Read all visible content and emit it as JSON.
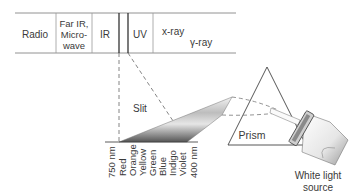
{
  "spectrum_band": {
    "regions": [
      {
        "label_lines": [
          "Radio"
        ]
      },
      {
        "label_lines": [
          "Far IR,",
          "Micro-",
          "wave"
        ]
      },
      {
        "label_lines": [
          "IR"
        ]
      },
      {
        "label_lines": [
          "UV"
        ]
      },
      {
        "label_lines": [
          "x-ray"
        ]
      },
      {
        "label_lines": [
          "γ-ray"
        ]
      }
    ]
  },
  "labels": {
    "slit": "Slit",
    "prism": "Prism",
    "source_line1": "White light",
    "source_line2": "source"
  },
  "spectrum_scale": {
    "start": "750 nm",
    "end": "400 nm",
    "colors": [
      "Red",
      "Orange",
      "Yellow",
      "Green",
      "Blue",
      "Indigo",
      "Violet"
    ]
  }
}
